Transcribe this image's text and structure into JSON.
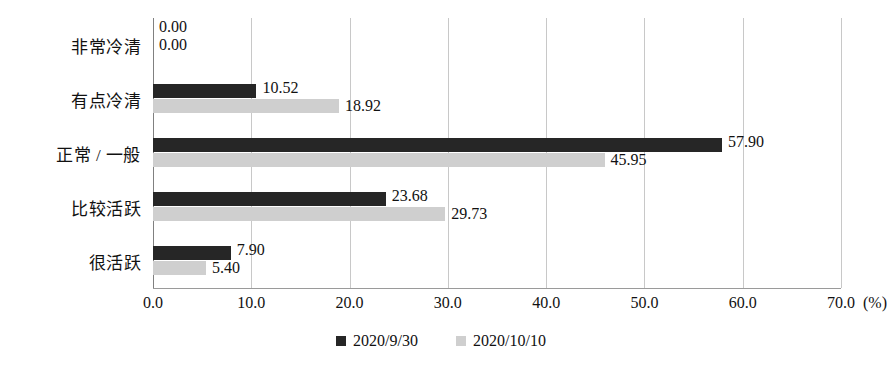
{
  "chart_data": {
    "type": "bar",
    "orientation": "horizontal",
    "title": "",
    "subtitle": "",
    "xlabel": "(%)",
    "ylabel": "",
    "xlim": [
      0,
      70
    ],
    "xticks": [
      "0.0",
      "10.0",
      "20.0",
      "30.0",
      "40.0",
      "50.0",
      "60.0",
      "70.0"
    ],
    "xtick_values": [
      0,
      10,
      20,
      30,
      40,
      50,
      60,
      70
    ],
    "grid": true,
    "legend_position": "bottom-center",
    "categories": [
      "非常冷清",
      "有点冷清",
      "正常 / 一般",
      "比较活跃",
      "很活跃"
    ],
    "series": [
      {
        "name": "2020/9/30",
        "color": "#262626",
        "values": [
          0.0,
          10.52,
          57.9,
          23.68,
          7.9
        ],
        "labels": [
          "0.00",
          "10.52",
          "57.90",
          "23.68",
          "7.90"
        ]
      },
      {
        "name": "2020/10/10",
        "color": "#cfcfcf",
        "values": [
          0.0,
          18.92,
          45.95,
          29.73,
          5.4
        ],
        "labels": [
          "0.00",
          "18.92",
          "45.95",
          "29.73",
          "5.40"
        ]
      }
    ]
  },
  "legend": {
    "items": [
      {
        "label": "2020/9/30",
        "color": "#262626"
      },
      {
        "label": "2020/10/10",
        "color": "#cfcfcf"
      }
    ]
  },
  "axis": {
    "unit": "(%)"
  }
}
